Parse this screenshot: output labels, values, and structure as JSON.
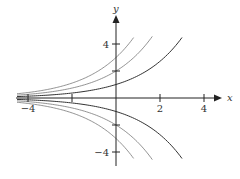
{
  "chart_data": {
    "type": "line",
    "title": "",
    "xlabel": "x",
    "ylabel": "y",
    "xlim": [
      -4.5,
      4.8
    ],
    "ylim": [
      -5.1,
      6.0
    ],
    "grid": false,
    "legend": null,
    "x_ticks": [
      -4,
      -2,
      2,
      4
    ],
    "x_tick_labels": [
      "−4",
      "",
      "2",
      "4"
    ],
    "y_ticks": [
      4,
      2,
      -2,
      -4
    ],
    "y_tick_labels": [
      "4",
      "",
      "",
      "−4"
    ],
    "function": "y = C·e^(x/2)",
    "series": [
      {
        "name": "C=3",
        "C": 3,
        "x_range": [
          -4.5,
          0.8
        ]
      },
      {
        "name": "C=2",
        "C": 2,
        "x_range": [
          -4.5,
          1.65
        ]
      },
      {
        "name": "C=1",
        "C": 1,
        "x_range": [
          -4.5,
          3.0
        ]
      },
      {
        "name": "C=-1",
        "C": -1,
        "x_range": [
          -4.5,
          3.0
        ]
      },
      {
        "name": "C=-2",
        "C": -2,
        "x_range": [
          -4.5,
          1.65
        ]
      },
      {
        "name": "C=-3",
        "C": -3,
        "x_range": [
          -4.5,
          0.8
        ]
      }
    ],
    "colors": {
      "axis": "#222222",
      "curve_dark": "#333333",
      "curve_light": "#777777"
    }
  }
}
